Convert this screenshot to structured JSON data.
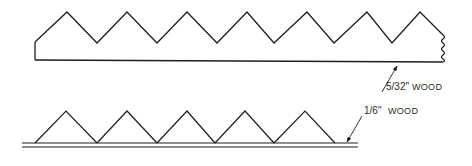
{
  "diagram": {
    "title": "",
    "stroke_color": "#1e1e1e",
    "background": "#ffffff",
    "top_piece": {
      "name": "serrated strip",
      "zigzag_points": [
        [
          35,
          42
        ],
        [
          67,
          12
        ],
        [
          97,
          43
        ],
        [
          127,
          12
        ],
        [
          157,
          43
        ],
        [
          187,
          12
        ],
        [
          217,
          43
        ],
        [
          247,
          12
        ],
        [
          274,
          43
        ],
        [
          307,
          12
        ],
        [
          334,
          43
        ],
        [
          367,
          12
        ],
        [
          392,
          43
        ],
        [
          420,
          12
        ],
        [
          443,
          35
        ]
      ],
      "left_edge": [
        [
          35,
          42
        ],
        [
          35,
          60
        ]
      ],
      "bottom_edge": [
        [
          35,
          60
        ],
        [
          443,
          62
        ]
      ],
      "break_line_x": 443,
      "break_line_y": [
        35,
        62
      ]
    },
    "bottom_piece": {
      "name": "triangles on base strip",
      "base_lines_y": [
        143,
        147
      ],
      "base_x_range": [
        22,
        358
      ],
      "triangles": [
        {
          "left": 35,
          "peak": 66,
          "right": 97
        },
        {
          "left": 97,
          "peak": 127,
          "right": 157
        },
        {
          "left": 157,
          "peak": 187,
          "right": 215
        },
        {
          "left": 215,
          "peak": 245,
          "right": 274
        },
        {
          "left": 274,
          "peak": 305,
          "right": 335
        }
      ],
      "peak_y": 111
    },
    "labels": {
      "top_label_fraction": "5/32\"",
      "top_label_material": "WOOD",
      "bottom_label_fraction": "1/6\"",
      "bottom_label_material": "WOOD"
    },
    "arrows": [
      {
        "name": "arrow-to-top-piece",
        "from": [
          382,
          92
        ],
        "to": [
          397,
          66
        ]
      },
      {
        "name": "arrow-to-bottom-piece",
        "from": [
          362,
          116
        ],
        "to": [
          347,
          142
        ]
      }
    ]
  }
}
